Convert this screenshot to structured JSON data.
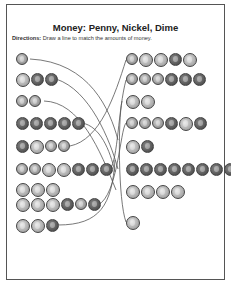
{
  "worksheet": {
    "title": "Money: Penny, Nickel, Dime",
    "directions_label": "Directions:",
    "directions_text": " Draw a line to match the amounts of money."
  },
  "legend": {
    "P": "penny",
    "N": "nickel",
    "D": "dime"
  },
  "left_column": [
    {
      "coins": [
        "D"
      ],
      "top": 53,
      "left": 16
    },
    {
      "coins": [
        "N",
        "P",
        "P"
      ],
      "top": 73,
      "left": 16
    },
    {
      "coins": [
        "D",
        "D"
      ],
      "top": 95,
      "left": 16
    },
    {
      "coins": [
        "P",
        "P",
        "P",
        "P",
        "P"
      ],
      "top": 117,
      "left": 16
    },
    {
      "coins": [
        "P",
        "N",
        "D",
        "D"
      ],
      "top": 140,
      "left": 16
    },
    {
      "coins": [
        "D",
        "D",
        "N",
        "N",
        "P",
        "P",
        "P"
      ],
      "top": 163,
      "left": 16
    },
    {
      "coins": [
        "N",
        "N",
        "N"
      ],
      "top": 183,
      "left": 16
    },
    {
      "coins": [
        "N",
        "N",
        "N",
        "P",
        "D",
        "P"
      ],
      "top": 198,
      "left": 16
    },
    {
      "coins": [
        "N",
        "N",
        "P"
      ],
      "top": 219,
      "left": 16
    }
  ],
  "right_column": [
    {
      "coins": [
        "D",
        "N",
        "N",
        "P",
        "N"
      ],
      "top": 53,
      "left": 126
    },
    {
      "coins": [
        "D",
        "D",
        "D",
        "P",
        "P",
        "P"
      ],
      "top": 73,
      "left": 126
    },
    {
      "coins": [
        "N",
        "N"
      ],
      "top": 95,
      "left": 126
    },
    {
      "coins": [
        "D",
        "D",
        "D",
        "P",
        "N",
        "P"
      ],
      "top": 117,
      "left": 126
    },
    {
      "coins": [
        "N",
        "P"
      ],
      "top": 140,
      "left": 126
    },
    {
      "coins": [
        "P",
        "P",
        "P",
        "P",
        "P",
        "P",
        "P",
        "P"
      ],
      "top": 163,
      "left": 126
    },
    {
      "coins": [
        "N",
        "N",
        "N",
        "N"
      ],
      "top": 185,
      "left": 126
    },
    {
      "coins": [
        "N"
      ],
      "top": 216,
      "left": 126
    }
  ],
  "lines": [
    "M30,59 C90,62 110,110 118,140",
    "M56,79 C90,90 110,140 118,169",
    "M44,101 C80,102 100,150 116,190",
    "M82,123 C100,126 110,150 115,172",
    "M70,146 C100,140 115,95 126,60",
    "M110,169 C118,160 118,110 126,80",
    "M98,205 C118,195 120,130 126,123",
    "M58,225 C100,225 112,205 115,160",
    "M122,101 C118,120 118,200 126,222"
  ],
  "colors": {
    "line": "#555555",
    "border": "#555555",
    "text": "#222222"
  }
}
